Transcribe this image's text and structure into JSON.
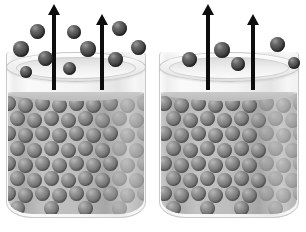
{
  "scene": {
    "title": "Evaporation from two beakers of liquid",
    "width": 306,
    "height": 232,
    "background": "#ffffff",
    "colors": {
      "free_sphere": "#3f3f3f",
      "liquid_sphere": "#6d6d6d",
      "liquid": "#bdbdbd",
      "glass": "#f2f2f2",
      "arrow": "#0d0d0d",
      "rim": "#e2e2e2"
    }
  },
  "beakers": [
    {
      "id": "left-beaker",
      "label": "Left beaker",
      "x": 6,
      "y": 52,
      "width": 140,
      "height": 166,
      "rim": {
        "x": 6,
        "y": 52,
        "width": 140,
        "height": 30
      },
      "rim_inner": {
        "x": 16,
        "y": 57,
        "width": 120,
        "height": 22
      },
      "liquid": {
        "top": 40,
        "height": 122
      },
      "arrows": [
        {
          "id": "arrow-left-1",
          "x": 48,
          "y": 4,
          "height": 86
        },
        {
          "id": "arrow-left-2",
          "x": 96,
          "y": 14,
          "height": 76
        }
      ],
      "free_spheres": [
        {
          "x": 30,
          "y": 24,
          "d": 15
        },
        {
          "x": 13,
          "y": 41,
          "d": 16
        },
        {
          "x": 67,
          "y": 25,
          "d": 14
        },
        {
          "x": 38,
          "y": 51,
          "d": 15
        },
        {
          "x": 112,
          "y": 21,
          "d": 15
        },
        {
          "x": 80,
          "y": 41,
          "d": 16
        },
        {
          "x": 131,
          "y": 40,
          "d": 15
        },
        {
          "x": 108,
          "y": 52,
          "d": 15
        },
        {
          "x": 63,
          "y": 62,
          "d": 13
        },
        {
          "x": 20,
          "y": 66,
          "d": 12
        }
      ],
      "escaping_count": 10
    },
    {
      "id": "right-beaker",
      "label": "Right beaker",
      "x": 159,
      "y": 52,
      "width": 140,
      "height": 166,
      "rim": {
        "x": 159,
        "y": 52,
        "width": 140,
        "height": 30
      },
      "rim_inner": {
        "x": 169,
        "y": 57,
        "width": 120,
        "height": 22
      },
      "liquid": {
        "top": 40,
        "height": 122
      },
      "arrows": [
        {
          "id": "arrow-right-1",
          "x": 202,
          "y": 4,
          "height": 86
        },
        {
          "id": "arrow-right-2",
          "x": 247,
          "y": 14,
          "height": 76
        }
      ],
      "free_spheres": [
        {
          "x": 214,
          "y": 42,
          "d": 16
        },
        {
          "x": 270,
          "y": 37,
          "d": 15
        },
        {
          "x": 182,
          "y": 52,
          "d": 15
        },
        {
          "x": 231,
          "y": 57,
          "d": 14
        },
        {
          "x": 288,
          "y": 57,
          "d": 12
        }
      ],
      "escaping_count": 5
    }
  ],
  "packing": {
    "sphere_diameter": 15,
    "col_step": 17,
    "row_step": 15,
    "rows": 8,
    "cols": 9
  }
}
